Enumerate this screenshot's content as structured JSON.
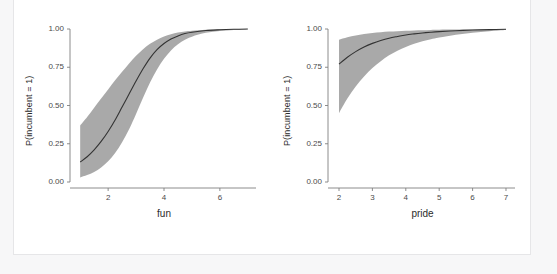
{
  "figure": {
    "background": "#ffffff",
    "page_background": "#f7f7f8",
    "border_color": "#e6e6e8",
    "ribbon_color": "#9a9a9a",
    "line_color": "#333333",
    "axis_color": "#808080",
    "text_color": "#2b2b2b"
  },
  "chart_data": [
    {
      "type": "line",
      "panel": "left",
      "title": "",
      "xlabel": "fun",
      "ylabel": "P(incumbent = 1)",
      "xlim": [
        0.85,
        7.15
      ],
      "ylim": [
        0.0,
        1.0
      ],
      "xticks": [
        2,
        4,
        6
      ],
      "xtick_labels": [
        "2",
        "4",
        "6"
      ],
      "yticks": [
        0.0,
        0.25,
        0.5,
        0.75,
        1.0
      ],
      "ytick_labels": [
        "0.00",
        "0.25",
        "0.50",
        "0.75",
        "1.00"
      ],
      "grid": false,
      "legend": "none",
      "series": [
        {
          "name": "predicted probability",
          "x": [
            1.0,
            1.25,
            1.5,
            1.75,
            2.0,
            2.25,
            2.5,
            2.75,
            3.0,
            3.25,
            3.5,
            3.75,
            4.0,
            4.25,
            4.5,
            4.75,
            5.0,
            5.5,
            6.0,
            6.5,
            7.0
          ],
          "values": [
            0.13,
            0.165,
            0.21,
            0.265,
            0.33,
            0.405,
            0.49,
            0.575,
            0.66,
            0.74,
            0.81,
            0.865,
            0.905,
            0.935,
            0.955,
            0.97,
            0.979,
            0.99,
            0.995,
            0.998,
            1.0
          ]
        }
      ],
      "ribbon": {
        "name": "confidence band",
        "x": [
          1.0,
          1.25,
          1.5,
          1.75,
          2.0,
          2.25,
          2.5,
          2.75,
          3.0,
          3.25,
          3.5,
          3.75,
          4.0,
          4.25,
          4.5,
          4.75,
          5.0,
          5.5,
          6.0,
          6.5,
          7.0
        ],
        "lower": [
          0.03,
          0.045,
          0.065,
          0.095,
          0.135,
          0.19,
          0.26,
          0.345,
          0.445,
          0.55,
          0.65,
          0.735,
          0.805,
          0.86,
          0.9,
          0.93,
          0.95,
          0.975,
          0.987,
          0.994,
          0.999
        ],
        "upper": [
          0.37,
          0.425,
          0.485,
          0.545,
          0.605,
          0.665,
          0.72,
          0.775,
          0.825,
          0.868,
          0.903,
          0.93,
          0.951,
          0.966,
          0.977,
          0.984,
          0.989,
          0.995,
          0.998,
          0.999,
          1.0
        ]
      }
    },
    {
      "type": "line",
      "panel": "right",
      "title": "",
      "xlabel": "pride",
      "ylabel": "P(incumbent = 1)",
      "xlim": [
        1.85,
        7.15
      ],
      "ylim": [
        0.0,
        1.0
      ],
      "xticks": [
        2,
        3,
        4,
        5,
        6,
        7
      ],
      "xtick_labels": [
        "2",
        "3",
        "4",
        "5",
        "6",
        "7"
      ],
      "yticks": [
        0.0,
        0.25,
        0.5,
        0.75,
        1.0
      ],
      "ytick_labels": [
        "0.00",
        "0.25",
        "0.50",
        "0.75",
        "1.00"
      ],
      "grid": false,
      "legend": "none",
      "series": [
        {
          "name": "predicted probability",
          "x": [
            2.0,
            2.25,
            2.5,
            2.75,
            3.0,
            3.25,
            3.5,
            3.75,
            4.0,
            4.25,
            4.5,
            4.75,
            5.0,
            5.5,
            6.0,
            6.5,
            7.0
          ],
          "values": [
            0.77,
            0.815,
            0.852,
            0.882,
            0.906,
            0.925,
            0.94,
            0.951,
            0.961,
            0.968,
            0.974,
            0.979,
            0.983,
            0.989,
            0.993,
            0.996,
            0.998
          ]
        }
      ],
      "ribbon": {
        "name": "confidence band",
        "x": [
          2.0,
          2.25,
          2.5,
          2.75,
          3.0,
          3.25,
          3.5,
          3.75,
          4.0,
          4.25,
          4.5,
          4.75,
          5.0,
          5.5,
          6.0,
          6.5,
          7.0
        ],
        "lower": [
          0.45,
          0.545,
          0.625,
          0.69,
          0.745,
          0.79,
          0.828,
          0.858,
          0.883,
          0.903,
          0.92,
          0.933,
          0.944,
          0.962,
          0.975,
          0.985,
          0.993
        ],
        "upper": [
          0.93,
          0.946,
          0.958,
          0.967,
          0.974,
          0.979,
          0.983,
          0.986,
          0.989,
          0.991,
          0.992,
          0.994,
          0.995,
          0.996,
          0.997,
          0.998,
          0.999
        ]
      }
    }
  ]
}
